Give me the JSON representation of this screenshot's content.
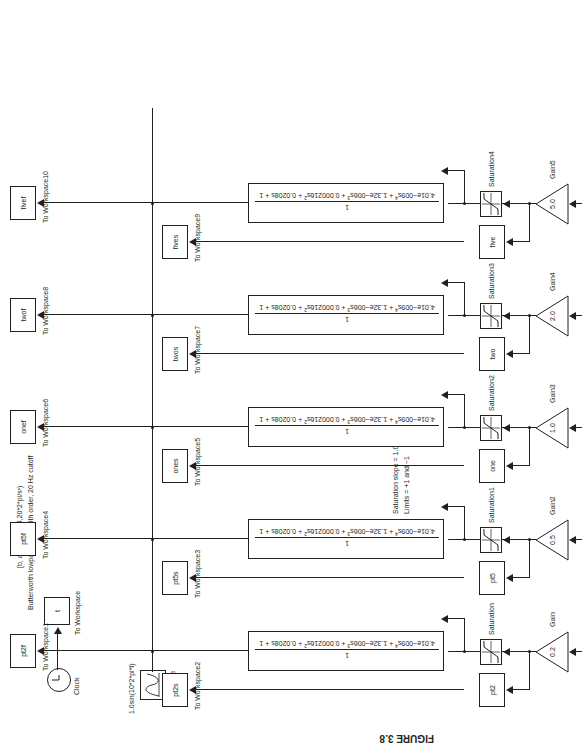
{
  "figure": {
    "caption": "FIGURE 3.8"
  },
  "annotations": {
    "butter_line1": "[b, a] = butter(4,20*2*pi/sˢ)",
    "butter_line2": "Butterworth lowpass filters, 4th order, 20 Hz cutoff",
    "saturation_line1": "Saturation slope = 1.0",
    "saturation_line2": "Limits = +1 and −1",
    "sine_expression": "1.0sin(10*2*pi*t)"
  },
  "source": {
    "clock_label": "Clock",
    "clock_icon": "clock-icon",
    "time_block": "t",
    "time_block_label": "To Workspace",
    "sine_label": "Sine wave",
    "sine_icon": "sine-wave-icon"
  },
  "transfer_function": {
    "numerator": "1",
    "denominator_plain": "4.01e−009s⁴ + 1.32e−006s³ + 0.000216s² + 0.0208s + 1",
    "den_parts": [
      {
        "coef": "4.01e−009s",
        "exp": "4"
      },
      {
        "coef": " + 1.32e−006s",
        "exp": "3"
      },
      {
        "coef": " + 0.000216s",
        "exp": "2"
      },
      {
        "coef": " + 0.0208s + 1",
        "exp": ""
      }
    ]
  },
  "channels": [
    {
      "gain_value": "0.2",
      "gain_label": "Gain",
      "sat_label": "Saturation",
      "sat_icon": "saturation-icon",
      "raw_block": "pt2",
      "raw_workspace": "To Workspace2",
      "raw_tap_block": "pt2s",
      "filtered_block": "pt2f",
      "filtered_workspace": "To Workspace1"
    },
    {
      "gain_value": "0.5",
      "gain_label": "Gain2",
      "sat_label": "Saturation1",
      "sat_icon": "saturation-icon",
      "raw_block": "pt5",
      "raw_workspace": "To Workspace3",
      "raw_tap_block": "pt5s",
      "filtered_block": "pt5f",
      "filtered_workspace": "To Workspace4"
    },
    {
      "gain_value": "1.0",
      "gain_label": "Gain3",
      "sat_label": "Saturation2",
      "sat_icon": "saturation-icon",
      "raw_block": "one",
      "raw_workspace": "To Workspace5",
      "raw_tap_block": "ones",
      "filtered_block": "onef",
      "filtered_workspace": "To Workspace6"
    },
    {
      "gain_value": "2.0",
      "gain_label": "Gain4",
      "sat_label": "Saturation3",
      "sat_icon": "saturation-icon",
      "raw_block": "two",
      "raw_workspace": "To Workspace7",
      "raw_tap_block": "twos",
      "filtered_block": "twof",
      "filtered_workspace": "To Workspace8"
    },
    {
      "gain_value": "5.0",
      "gain_label": "Gain5",
      "sat_label": "Saturation4",
      "sat_icon": "saturation-icon",
      "raw_block": "five",
      "raw_workspace": "To Workspace9",
      "raw_tap_block": "fives",
      "filtered_block": "fivef",
      "filtered_workspace": "To Workspace10"
    }
  ],
  "colors": {
    "ink": "#231f20",
    "paper": "#ffffff"
  }
}
